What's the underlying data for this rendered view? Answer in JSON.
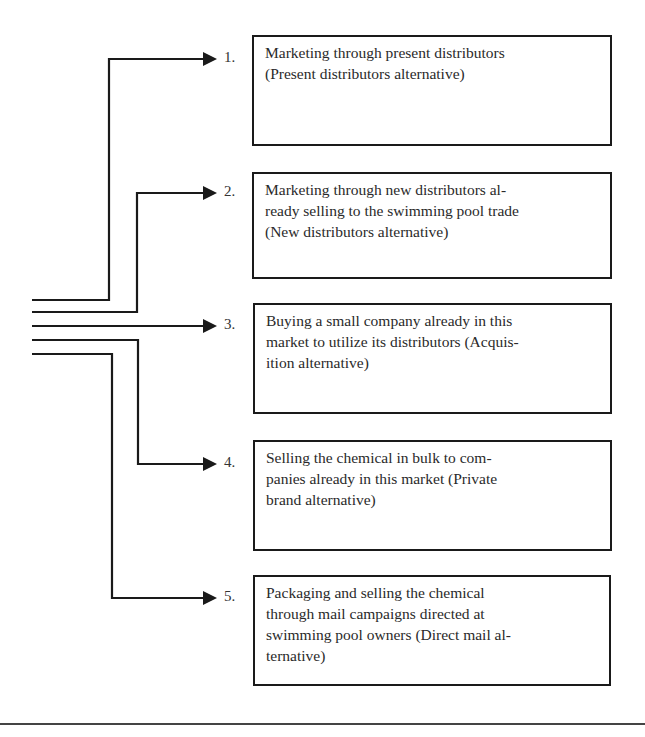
{
  "diagram": {
    "type": "branching-alternatives",
    "line_color": "#1a1a1a",
    "alternatives": [
      {
        "number": "1.",
        "text": "Marketing through present distributors (Present distributors alternative)",
        "lines": [
          "Marketing through present distributors",
          "(Present distributors alternative)"
        ]
      },
      {
        "number": "2.",
        "text": "Marketing through new distributors already selling to the swimming pool trade (New distributors alternative)",
        "lines": [
          "Marketing through new distributors al-",
          "ready selling to the swimming pool trade",
          "(New distributors alternative)"
        ]
      },
      {
        "number": "3.",
        "text": "Buying a small company already in this market to utilize its distributors (Acquisition alternative)",
        "lines": [
          "Buying a small company already in this",
          "market to utilize its distributors (Acquis-",
          "ition alternative)"
        ]
      },
      {
        "number": "4.",
        "text": "Selling the chemical in bulk to companies already in this market (Private brand alternative)",
        "lines": [
          "Selling the chemical in bulk to com-",
          "panies already in this market (Private",
          "brand alternative)"
        ]
      },
      {
        "number": "5.",
        "text": "Packaging and selling the chemical through mail campaigns directed at swimming pool owners (Direct mail alternative)",
        "lines": [
          "Packaging and selling the chemical",
          "through mail campaigns directed at",
          "swimming pool owners (Direct mail al-",
          "ternative)"
        ]
      }
    ]
  }
}
